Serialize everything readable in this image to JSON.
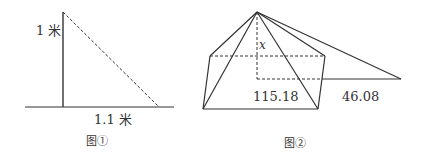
{
  "figure1": {
    "caption": "图①",
    "height_label": "1 米",
    "base_label": "1.1 米",
    "stroke_color": "#333333"
  },
  "figure2": {
    "caption": "图②",
    "height_label": "x",
    "half_base_label": "115.18",
    "shadow_label": "46.08",
    "stroke_color": "#333333"
  }
}
